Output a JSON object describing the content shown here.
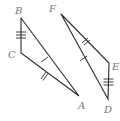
{
  "figure": {
    "type": "congruent-triangles",
    "triangles": [
      {
        "name": "ABC",
        "vertices": {
          "A": {
            "label": "A",
            "x": 79,
            "y": 96
          },
          "B": {
            "label": "B",
            "x": 21,
            "y": 18
          },
          "C": {
            "label": "C",
            "x": 21,
            "y": 53
          }
        },
        "sides": [
          {
            "segment": "BC",
            "ticks": 3
          },
          {
            "segment": "CA",
            "ticks": 2
          },
          {
            "segment": "BA",
            "ticks": 1
          }
        ]
      },
      {
        "name": "DEF",
        "vertices": {
          "D": {
            "label": "D",
            "x": 108,
            "y": 99
          },
          "E": {
            "label": "E",
            "x": 109,
            "y": 63
          },
          "F": {
            "label": "F",
            "x": 61,
            "y": 14
          }
        },
        "sides": [
          {
            "segment": "ED",
            "ticks": 3
          },
          {
            "segment": "FE",
            "ticks": 2
          },
          {
            "segment": "FD",
            "ticks": 1
          }
        ]
      }
    ],
    "labels": {
      "A": "A",
      "B": "B",
      "C": "C",
      "D": "D",
      "E": "E",
      "F": "F"
    },
    "colors": {
      "stroke": "#2a2a2a",
      "label": "#777777",
      "background": "#ffffff"
    }
  }
}
